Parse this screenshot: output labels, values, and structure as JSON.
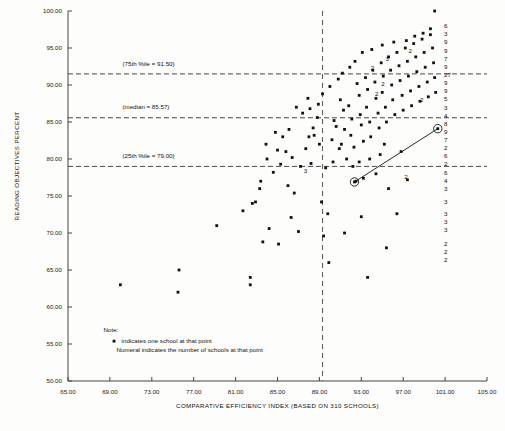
{
  "chart_data": {
    "type": "scatter",
    "title": "",
    "xlabel": "COMPARATIVE EFFICIENCY INDEX (BASED ON 310 SCHOOLS)",
    "ylabel": "READING OBJECTIVES PERCENT",
    "xlim": [
      65.0,
      105.0
    ],
    "ylim": [
      50.0,
      100.0
    ],
    "xticks": [
      65.0,
      69.0,
      73.0,
      77.0,
      81.0,
      85.0,
      89.0,
      93.0,
      97.0,
      101.0,
      105.0
    ],
    "xticklabels": [
      "65.00",
      "69.00",
      "73.00",
      "77.00",
      "81.00",
      "85.00",
      "89.00",
      "93.00",
      "97.00",
      "101.00",
      "105.00"
    ],
    "yticks": [
      50.0,
      55.0,
      60.0,
      65.0,
      70.0,
      75.0,
      80.0,
      85.0,
      90.0,
      95.0,
      100.0
    ],
    "yticklabels": [
      "50.00",
      "55.00",
      "60.00",
      "65.00",
      "70.00",
      "75.00",
      "80.00",
      "85.00",
      "90.00",
      "95.00",
      "100.00"
    ],
    "grid": false,
    "legend": "none",
    "reference_lines": [
      {
        "orientation": "horizontal",
        "value": 91.5,
        "label": "(75th %ile = 91.50)",
        "label_x": 70.2,
        "label_y": 92.6,
        "style": "dashed"
      },
      {
        "orientation": "horizontal",
        "value": 85.57,
        "label": "(median = 85.57)",
        "label_x": 70.2,
        "label_y": 86.7,
        "style": "dashed"
      },
      {
        "orientation": "horizontal",
        "value": 79.0,
        "label": "(25th %ile = 79.00)",
        "label_x": 70.2,
        "label_y": 80.2,
        "style": "dashed"
      },
      {
        "orientation": "vertical",
        "value": 89.3,
        "label": "",
        "style": "dashed"
      }
    ],
    "highlighted_points": [
      {
        "x": 92.35,
        "y": 76.9,
        "marker": "circled-dot"
      },
      {
        "x": 100.3,
        "y": 84.1,
        "marker": "circled-dot"
      }
    ],
    "connector": {
      "from": [
        92.35,
        76.9
      ],
      "to": [
        100.3,
        84.1
      ]
    },
    "points": [
      [
        70.0,
        63.0
      ],
      [
        75.6,
        65.0
      ],
      [
        75.5,
        62.0
      ],
      [
        79.2,
        71.0
      ],
      [
        81.7,
        73.0
      ],
      [
        82.6,
        74.0
      ],
      [
        82.4,
        64.0
      ],
      [
        82.4,
        63.0
      ],
      [
        83.4,
        77.0
      ],
      [
        83.3,
        76.0
      ],
      [
        82.9,
        74.2
      ],
      [
        84.0,
        80.0
      ],
      [
        84.6,
        78.2
      ],
      [
        85.3,
        79.3
      ],
      [
        85.8,
        81.0
      ],
      [
        86.4,
        80.2
      ],
      [
        86.0,
        76.4
      ],
      [
        86.6,
        75.4
      ],
      [
        87.2,
        79.0
      ],
      [
        87.7,
        81.4
      ],
      [
        88.0,
        83.0
      ],
      [
        85.1,
        68.5
      ],
      [
        86.3,
        72.1
      ],
      [
        87.0,
        70.2
      ],
      [
        84.2,
        70.6
      ],
      [
        83.6,
        68.8
      ],
      [
        88.4,
        84.2
      ],
      [
        88.5,
        83.2
      ],
      [
        88.8,
        85.6
      ],
      [
        89.0,
        82.0
      ],
      [
        88.2,
        79.4
      ],
      [
        89.6,
        78.8
      ],
      [
        89.2,
        74.2
      ],
      [
        89.8,
        72.6
      ],
      [
        89.4,
        69.6
      ],
      [
        89.9,
        66.0
      ],
      [
        90.4,
        85.2
      ],
      [
        90.6,
        84.4
      ],
      [
        90.2,
        82.6
      ],
      [
        90.9,
        81.4
      ],
      [
        90.3,
        79.6
      ],
      [
        91.0,
        88.0
      ],
      [
        91.3,
        86.6
      ],
      [
        91.4,
        84.0
      ],
      [
        91.1,
        82.0
      ],
      [
        91.6,
        80.0
      ],
      [
        91.8,
        87.2
      ],
      [
        92.1,
        85.4
      ],
      [
        92.0,
        83.2
      ],
      [
        92.3,
        81.6
      ],
      [
        92.2,
        79.0
      ],
      [
        92.6,
        90.2
      ],
      [
        92.8,
        88.6
      ],
      [
        92.9,
        86.0
      ],
      [
        93.0,
        84.6
      ],
      [
        93.2,
        82.4
      ],
      [
        93.4,
        91.0
      ],
      [
        93.6,
        89.4
      ],
      [
        93.5,
        87.0
      ],
      [
        93.8,
        85.0
      ],
      [
        93.9,
        83.0
      ],
      [
        94.1,
        92.0
      ],
      [
        94.3,
        90.4
      ],
      [
        94.4,
        88.2
      ],
      [
        94.6,
        86.2
      ],
      [
        94.7,
        84.2
      ],
      [
        94.9,
        93.0
      ],
      [
        95.1,
        91.2
      ],
      [
        95.0,
        89.0
      ],
      [
        95.3,
        87.0
      ],
      [
        95.4,
        85.0
      ],
      [
        95.6,
        93.8
      ],
      [
        95.8,
        92.0
      ],
      [
        95.9,
        90.0
      ],
      [
        96.0,
        88.0
      ],
      [
        96.2,
        86.0
      ],
      [
        96.4,
        94.4
      ],
      [
        96.6,
        92.6
      ],
      [
        96.7,
        90.6
      ],
      [
        96.9,
        88.6
      ],
      [
        97.0,
        86.6
      ],
      [
        97.2,
        95.0
      ],
      [
        97.4,
        93.2
      ],
      [
        97.5,
        91.2
      ],
      [
        97.7,
        89.2
      ],
      [
        97.8,
        87.2
      ],
      [
        98.0,
        95.6
      ],
      [
        98.2,
        93.8
      ],
      [
        98.3,
        91.8
      ],
      [
        98.5,
        89.8
      ],
      [
        98.6,
        87.8
      ],
      [
        98.8,
        96.2
      ],
      [
        99.0,
        94.4
      ],
      [
        99.1,
        92.4
      ],
      [
        99.3,
        90.4
      ],
      [
        99.4,
        88.4
      ],
      [
        99.6,
        96.8
      ],
      [
        99.8,
        95.0
      ],
      [
        99.9,
        93.0
      ],
      [
        100.0,
        91.0
      ],
      [
        100.1,
        89.0
      ],
      [
        100.0,
        100.0
      ],
      [
        99.6,
        97.6
      ],
      [
        98.9,
        97.0
      ],
      [
        98.1,
        96.6
      ],
      [
        97.3,
        96.0
      ],
      [
        93.1,
        94.4
      ],
      [
        94.0,
        94.8
      ],
      [
        92.4,
        93.2
      ],
      [
        91.9,
        92.4
      ],
      [
        91.2,
        91.6
      ],
      [
        90.8,
        90.8
      ],
      [
        90.0,
        89.8
      ],
      [
        89.3,
        88.8
      ],
      [
        95.0,
        95.4
      ],
      [
        96.1,
        95.8
      ],
      [
        92.5,
        77.0
      ],
      [
        93.2,
        77.4
      ],
      [
        94.4,
        78.0
      ],
      [
        95.6,
        76.0
      ],
      [
        97.4,
        77.2
      ],
      [
        93.0,
        72.2
      ],
      [
        96.4,
        72.6
      ],
      [
        95.4,
        68.0
      ],
      [
        93.6,
        64.0
      ],
      [
        91.4,
        70.0
      ],
      [
        94.8,
        80.6
      ],
      [
        96.8,
        81.0
      ],
      [
        95.2,
        82.0
      ],
      [
        93.8,
        80.0
      ],
      [
        92.8,
        79.6
      ],
      [
        86.8,
        87.0
      ],
      [
        87.4,
        86.2
      ],
      [
        88.1,
        86.8
      ],
      [
        87.9,
        88.2
      ],
      [
        88.9,
        87.4
      ],
      [
        84.8,
        83.6
      ],
      [
        85.5,
        83.0
      ],
      [
        86.1,
        84.0
      ],
      [
        83.9,
        82.0
      ],
      [
        85.0,
        81.2
      ]
    ],
    "numeral_labels": [
      {
        "x": 100.9,
        "y": 98.0,
        "text": "6"
      },
      {
        "x": 100.9,
        "y": 96.9,
        "text": "3"
      },
      {
        "x": 100.9,
        "y": 95.8,
        "text": "9"
      },
      {
        "x": 100.9,
        "y": 94.7,
        "text": "9"
      },
      {
        "x": 100.9,
        "y": 93.6,
        "text": "7"
      },
      {
        "x": 100.9,
        "y": 92.5,
        "text": "9"
      },
      {
        "x": 100.9,
        "y": 91.4,
        "text": "27"
      },
      {
        "x": 100.9,
        "y": 90.3,
        "text": "9"
      },
      {
        "x": 100.9,
        "y": 89.2,
        "text": "9"
      },
      {
        "x": 100.9,
        "y": 88.1,
        "text": "5"
      },
      {
        "x": 100.9,
        "y": 87.0,
        "text": "3"
      },
      {
        "x": 100.9,
        "y": 85.9,
        "text": "4"
      },
      {
        "x": 100.9,
        "y": 84.8,
        "text": "8"
      },
      {
        "x": 100.9,
        "y": 83.7,
        "text": "9"
      },
      {
        "x": 100.9,
        "y": 82.6,
        "text": "7"
      },
      {
        "x": 100.9,
        "y": 81.5,
        "text": "2"
      },
      {
        "x": 100.9,
        "y": 80.4,
        "text": "6"
      },
      {
        "x": 100.9,
        "y": 79.3,
        "text": "2"
      },
      {
        "x": 100.9,
        "y": 78.2,
        "text": "6"
      },
      {
        "x": 100.9,
        "y": 77.1,
        "text": "4"
      },
      {
        "x": 100.9,
        "y": 76.0,
        "text": "3"
      },
      {
        "x": 100.9,
        "y": 74.2,
        "text": "3"
      },
      {
        "x": 100.9,
        "y": 72.6,
        "text": "3"
      },
      {
        "x": 100.9,
        "y": 71.5,
        "text": "3"
      },
      {
        "x": 100.9,
        "y": 70.4,
        "text": "3"
      },
      {
        "x": 100.9,
        "y": 68.6,
        "text": "2"
      },
      {
        "x": 100.9,
        "y": 67.5,
        "text": "2"
      },
      {
        "x": 100.9,
        "y": 66.4,
        "text": "2"
      },
      {
        "x": 95.3,
        "y": 93.6,
        "text": "3"
      },
      {
        "x": 93.9,
        "y": 92.4,
        "text": "2"
      },
      {
        "x": 94.9,
        "y": 90.2,
        "text": "2"
      },
      {
        "x": 94.3,
        "y": 88.8,
        "text": "2"
      },
      {
        "x": 97.5,
        "y": 94.6,
        "text": "2"
      },
      {
        "x": 98.6,
        "y": 88.0,
        "text": "2"
      },
      {
        "x": 87.5,
        "y": 78.4,
        "text": "3"
      },
      {
        "x": 97.1,
        "y": 77.6,
        "text": "2"
      }
    ]
  },
  "note": {
    "heading": "Note:",
    "line1": "indicates one school at that point",
    "line2": "Numeral indicates the number of schools at that point",
    "bullet_marker": "square-dot-marker"
  }
}
